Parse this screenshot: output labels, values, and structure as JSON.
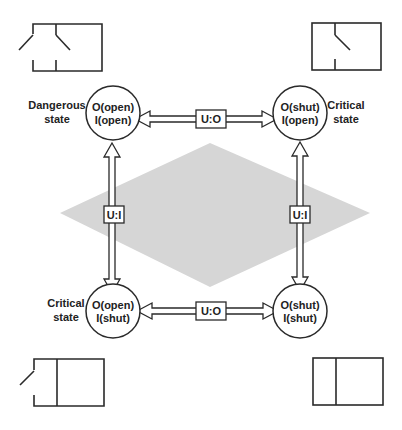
{
  "diagram": {
    "colors": {
      "line": "#2a2a2a",
      "diamond": "#d6d6d6",
      "background": "#ffffff"
    },
    "states": [
      {
        "id": "top-left",
        "line1": "O(open)",
        "line2": "I(open)",
        "side_label_1": "Dangerous",
        "side_label_2": "state"
      },
      {
        "id": "top-right",
        "line1": "O(shut)",
        "line2": "I(open)",
        "side_label_1": "Critical",
        "side_label_2": "state"
      },
      {
        "id": "bottom-left",
        "line1": "O(open)",
        "line2": "I(shut)",
        "side_label_1": "Critical",
        "side_label_2": "state"
      },
      {
        "id": "bottom-right",
        "line1": "O(shut)",
        "line2": "I(shut)",
        "side_label_1": "",
        "side_label_2": ""
      }
    ],
    "transitions": [
      {
        "id": "top",
        "label": "U:O"
      },
      {
        "id": "bottom",
        "label": "U:O"
      },
      {
        "id": "left",
        "label": "U:I"
      },
      {
        "id": "right",
        "label": "U:I"
      }
    ],
    "switch_icons": [
      {
        "id": "top-left",
        "desc": "both switches open"
      },
      {
        "id": "top-right",
        "desc": "outer closed, inner open"
      },
      {
        "id": "bottom-left",
        "desc": "outer open, inner closed"
      },
      {
        "id": "bottom-right",
        "desc": "both switches closed"
      }
    ]
  }
}
